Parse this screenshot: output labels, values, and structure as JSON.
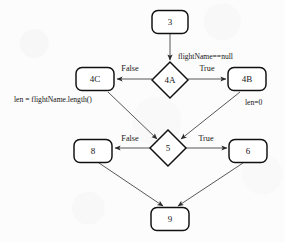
{
  "diagram": {
    "type": "control-flow-graph",
    "title": "",
    "background_color": "#fcfcfc",
    "node_fill": "#ffffff",
    "node_stroke": "#101010",
    "edge_color": "#4e4e4e",
    "nodes": [
      {
        "id": "n3",
        "label": "3",
        "shape": "rounded-rect",
        "cx": 170,
        "cy": 22,
        "w": 36,
        "h": 23
      },
      {
        "id": "n4A",
        "label": "4A",
        "shape": "diamond",
        "cx": 170,
        "cy": 80,
        "w": 34,
        "h": 36
      },
      {
        "id": "n4C",
        "label": "4C",
        "shape": "rounded-rect",
        "cx": 95,
        "cy": 79,
        "w": 38,
        "h": 23
      },
      {
        "id": "n4B",
        "label": "4B",
        "shape": "rounded-rect",
        "cx": 247,
        "cy": 79,
        "w": 38,
        "h": 23
      },
      {
        "id": "n5",
        "label": "5",
        "shape": "diamond",
        "cx": 168,
        "cy": 148,
        "w": 34,
        "h": 36
      },
      {
        "id": "n8",
        "label": "8",
        "shape": "rounded-rect",
        "cx": 93,
        "cy": 151,
        "w": 38,
        "h": 23
      },
      {
        "id": "n6",
        "label": "6",
        "shape": "rounded-rect",
        "cx": 248,
        "cy": 151,
        "w": 38,
        "h": 23
      },
      {
        "id": "n9",
        "label": "9",
        "shape": "rounded-rect",
        "cx": 170,
        "cy": 219,
        "w": 38,
        "h": 23
      }
    ],
    "edges": [
      {
        "id": "e-3-4A",
        "from": "n3",
        "to": "n4A",
        "label": "",
        "arrow": true
      },
      {
        "id": "e-4A-4C",
        "from": "n4A",
        "to": "n4C",
        "label": "False",
        "arrow": true
      },
      {
        "id": "e-4A-4B",
        "from": "n4A",
        "to": "n4B",
        "label": "True",
        "arrow": true
      },
      {
        "id": "e-4C-5",
        "from": "n4C",
        "to": "n5",
        "label": "",
        "arrow": true
      },
      {
        "id": "e-4B-5",
        "from": "n4B",
        "to": "n5",
        "label": "",
        "arrow": true
      },
      {
        "id": "e-5-8",
        "from": "n5",
        "to": "n8",
        "label": "False",
        "arrow": true
      },
      {
        "id": "e-5-6",
        "from": "n5",
        "to": "n6",
        "label": "True",
        "arrow": true
      },
      {
        "id": "e-8-9",
        "from": "n8",
        "to": "n9",
        "label": "",
        "arrow": true
      },
      {
        "id": "e-6-9",
        "from": "n6",
        "to": "n9",
        "label": "",
        "arrow": true
      }
    ],
    "edge_labels": {
      "false_left_top": "False",
      "true_right_top": "True",
      "false_left_bottom": "False",
      "true_right_bottom": "True"
    },
    "annotations": [
      {
        "id": "a-condition",
        "text": "flightName==null",
        "x": 178,
        "y": 57,
        "anchor": "start"
      },
      {
        "id": "a-len-assign",
        "text": "len = flightName.length()",
        "x": 14,
        "y": 100,
        "anchor": "start"
      },
      {
        "id": "a-len-zero",
        "text": "len=0",
        "x": 245,
        "y": 103,
        "anchor": "start"
      }
    ]
  }
}
